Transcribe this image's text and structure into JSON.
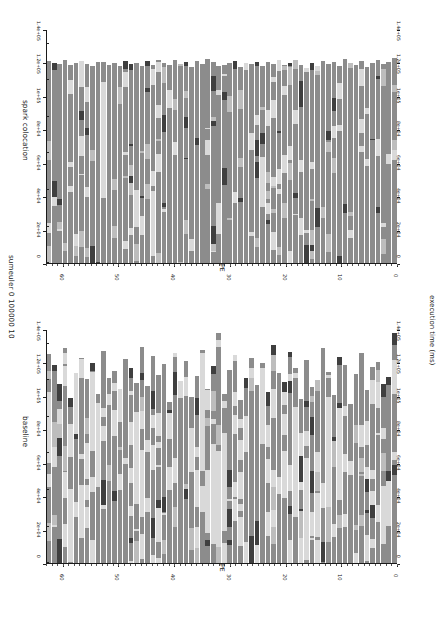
{
  "figure": {
    "suptitle": "sumeuler 0 100000 10",
    "value_axis_label": "execution time (ms)",
    "category_axis_label": "PE",
    "background": "#ffffff",
    "orientation": "rotated-90"
  },
  "palette": {
    "work": "#8c8c8c",
    "idle": "#d9d9d9",
    "gc": "#3f3f3f",
    "comm": "#bdbdbd",
    "separator": "#ffffff",
    "axis": "#1a1a1a"
  },
  "chart_data": [
    {
      "type": "bar",
      "title": "spark colocation",
      "panel": "top",
      "xlabel": "PE",
      "ylabel": "execution time (ms)",
      "orientation": "horizontal-rotated",
      "grid": false,
      "legend": "none",
      "xlim": [
        0,
        64
      ],
      "ylim": [
        0,
        140000
      ],
      "value_ticks": [
        0,
        20000,
        40000,
        60000,
        80000,
        100000,
        120000,
        140000
      ],
      "value_tick_labels": [
        "0",
        "2e+04",
        "4e+04",
        "6e+04",
        "8e+04",
        "1e+05",
        "1.2e+05",
        "1.4e+05"
      ],
      "category_ticks": [
        0,
        10,
        20,
        30,
        40,
        50,
        60
      ],
      "category_tick_labels": [
        "0",
        "10",
        "20",
        "30",
        "40",
        "50",
        "60"
      ],
      "categories": [
        0,
        1,
        2,
        3,
        4,
        5,
        6,
        7,
        8,
        9,
        10,
        11,
        12,
        13,
        14,
        15,
        16,
        17,
        18,
        19,
        20,
        21,
        22,
        23,
        24,
        25,
        26,
        27,
        28,
        29,
        30,
        31,
        32,
        33,
        34,
        35,
        36,
        37,
        38,
        39,
        40,
        41,
        42,
        43,
        44,
        45,
        46,
        47,
        48,
        49,
        50,
        51,
        52,
        53,
        54,
        55,
        56,
        57,
        58,
        59,
        60,
        61,
        62,
        63
      ],
      "values": [
        123000,
        121000,
        119500,
        122000,
        120500,
        118000,
        121500,
        119000,
        120000,
        122500,
        118500,
        120800,
        119800,
        121200,
        118200,
        120100,
        117500,
        119300,
        121800,
        120400,
        118900,
        122200,
        119600,
        120700,
        118400,
        121100,
        119900,
        120300,
        117900,
        121600,
        120200,
        119100,
        118700,
        120900,
        122400,
        119400,
        121300,
        118100,
        120600,
        119700,
        121900,
        118800,
        120000,
        122100,
        119200,
        121400,
        118600,
        120500,
        119500,
        121700,
        118300,
        120200,
        119000,
        121000,
        120800,
        118500,
        119900,
        121500,
        120100,
        118900,
        122000,
        119600,
        120400,
        121200
      ],
      "segment_types": [
        "work",
        "idle",
        "gc",
        "comm"
      ],
      "notes": "64 PE bars; predominantly 'work' (mid gray) with sparse light idle runs and occasional dark GC blocks near bar tips"
    },
    {
      "type": "bar",
      "title": "baseline",
      "panel": "bottom",
      "xlabel": "PE",
      "ylabel": "execution time (ms)",
      "orientation": "horizontal-rotated",
      "grid": false,
      "legend": "none",
      "xlim": [
        0,
        64
      ],
      "ylim": [
        0,
        140000
      ],
      "value_ticks": [
        0,
        20000,
        40000,
        60000,
        80000,
        100000,
        120000,
        140000
      ],
      "value_tick_labels": [
        "0",
        "2e+04",
        "4e+04",
        "6e+04",
        "8e+04",
        "1e+05",
        "1.2e+05",
        "1.4e+05"
      ],
      "category_ticks": [
        0,
        10,
        20,
        30,
        40,
        50,
        60
      ],
      "category_tick_labels": [
        "0",
        "10",
        "20",
        "30",
        "40",
        "50",
        "60"
      ],
      "categories": [
        0,
        1,
        2,
        3,
        4,
        5,
        6,
        7,
        8,
        9,
        10,
        11,
        12,
        13,
        14,
        15,
        16,
        17,
        18,
        19,
        20,
        21,
        22,
        23,
        24,
        25,
        26,
        27,
        28,
        29,
        30,
        31,
        32,
        33,
        34,
        35,
        36,
        37,
        38,
        39,
        40,
        41,
        42,
        43,
        44,
        45,
        46,
        47,
        48,
        49,
        50,
        51,
        52,
        53,
        54,
        55,
        56,
        57,
        58,
        59,
        60,
        61,
        62,
        63
      ],
      "values": [
        138000,
        112000,
        108000,
        121000,
        118000,
        104000,
        126000,
        113500,
        96000,
        119000,
        124000,
        101000,
        115000,
        129000,
        110000,
        106000,
        122000,
        99000,
        117000,
        127000,
        109000,
        114000,
        131000,
        103000,
        120000,
        107000,
        123000,
        111000,
        98000,
        125000,
        116000,
        102000,
        138500,
        118500,
        105000,
        128000,
        112500,
        100000,
        121500,
        109500,
        126500,
        97000,
        119500,
        113000,
        124500,
        106500,
        130000,
        108500,
        117500,
        122500,
        104500,
        115500,
        111500,
        127500,
        101500,
        120500,
        110500,
        123500,
        114500,
        99500,
        129500,
        107500,
        118800,
        125500
      ],
      "segment_types": [
        "work",
        "idle",
        "gc",
        "comm"
      ],
      "notes": "64 PE bars; much larger light 'idle' runs and more dark GC blocks than spark colocation; taller/more variable bar tips"
    }
  ]
}
